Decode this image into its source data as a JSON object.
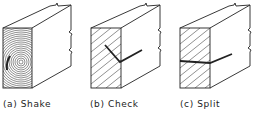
{
  "figure": {
    "panels": [
      {
        "id": "a",
        "label": "(a) Shake",
        "defect": "shake"
      },
      {
        "id": "b",
        "label": "(b) Check",
        "defect": "check"
      },
      {
        "id": "c",
        "label": "(c) Split",
        "defect": "split"
      }
    ]
  },
  "colors": {
    "line": "#222222",
    "background": "#ffffff"
  }
}
